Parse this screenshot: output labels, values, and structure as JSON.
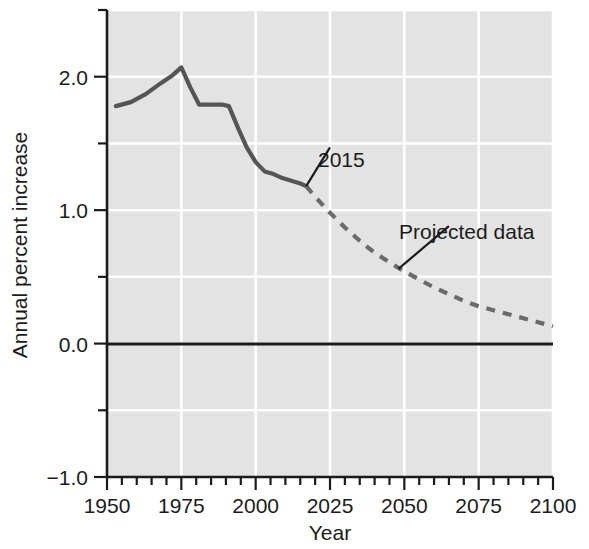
{
  "chart_data": {
    "type": "line",
    "title": "",
    "subtitle": "",
    "xlabel": "Year",
    "ylabel": "Annual percent increase",
    "xlim": [
      1950,
      2100
    ],
    "ylim": [
      -1.0,
      2.5
    ],
    "x_ticks": [
      1950,
      1975,
      2000,
      2025,
      2050,
      2075,
      2100
    ],
    "x_tick_labels": [
      "1950",
      "1975",
      "2000",
      "2025",
      "2050",
      "2075",
      "2100"
    ],
    "x_minor_tick_step": 5,
    "y_ticks": [
      -1.0,
      0.0,
      1.0,
      2.0
    ],
    "y_tick_labels": [
      "−1.0",
      "0.0",
      "1.0",
      "2.0"
    ],
    "y_minor_ticks": [
      -0.5,
      0.5,
      1.5,
      2.5
    ],
    "grid": true,
    "grid_color": "#ffffff",
    "plot_background": "#e3e3e3",
    "legend": "none",
    "zero_line": {
      "value": 0.0,
      "color": "#1b1b1b",
      "width": 3
    },
    "series": [
      {
        "name": "Observed data",
        "style": "solid",
        "color": "#555555",
        "x": [
          1953,
          1958,
          1963,
          1968,
          1972,
          1975,
          1978,
          1981,
          1985,
          1989,
          1991,
          1994,
          1997,
          2000,
          2003,
          2006,
          2009,
          2012,
          2015,
          2017
        ],
        "values": [
          1.78,
          1.81,
          1.87,
          1.95,
          2.01,
          2.07,
          1.92,
          1.79,
          1.79,
          1.79,
          1.78,
          1.62,
          1.47,
          1.36,
          1.29,
          1.27,
          1.24,
          1.22,
          1.2,
          1.18
        ]
      },
      {
        "name": "Projected data",
        "style": "dashed",
        "color": "#6a6a6a",
        "x": [
          2017,
          2020,
          2025,
          2030,
          2035,
          2040,
          2045,
          2050,
          2055,
          2060,
          2065,
          2070,
          2075,
          2080,
          2085,
          2090,
          2095,
          2100
        ],
        "values": [
          1.18,
          1.1,
          0.98,
          0.87,
          0.77,
          0.68,
          0.61,
          0.54,
          0.48,
          0.42,
          0.37,
          0.32,
          0.28,
          0.25,
          0.22,
          0.19,
          0.16,
          0.13
        ]
      }
    ],
    "annotations": [
      {
        "text": "2015",
        "x": 2025,
        "y": 1.47,
        "points_to": {
          "x": 2017,
          "y": 1.18
        }
      },
      {
        "text": "Projected data",
        "x": 2065,
        "y": 0.88,
        "points_to": {
          "x": 2048,
          "y": 0.56
        }
      }
    ]
  },
  "axis": {
    "ylabel": "Annual percent increase",
    "xlabel": "Year",
    "y_labels": [
      "2.0",
      "1.0",
      "0.0",
      "−1.0"
    ],
    "x_labels": [
      "1950",
      "1975",
      "2000",
      "2025",
      "2050",
      "2075",
      "2100"
    ]
  },
  "annotations": {
    "year_callout": "2015",
    "projected_callout": "Projected data"
  }
}
